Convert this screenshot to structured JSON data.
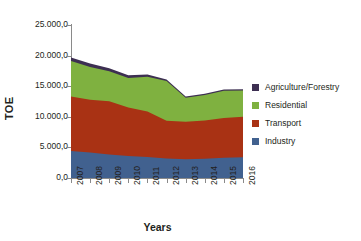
{
  "chart_data": {
    "type": "area",
    "stacked": true,
    "title": "",
    "xlabel": "Years",
    "ylabel": "TOE",
    "categories": [
      "2007",
      "2008",
      "2009",
      "2010",
      "2011",
      "2012",
      "2013",
      "2014",
      "2015",
      "2016"
    ],
    "ylim": [
      0,
      25000
    ],
    "ytick_values": [
      0,
      5000,
      10000,
      15000,
      20000,
      25000
    ],
    "ytick_labels": [
      "0,0",
      "5.000,0",
      "10.000,0",
      "15.000,0",
      "20.000,0",
      "25.000,0"
    ],
    "grid": false,
    "legend_position": "right",
    "series": [
      {
        "name": "Industry",
        "color": "#41618f",
        "values": [
          4400,
          4150,
          3850,
          3600,
          3450,
          3200,
          3050,
          3150,
          3300,
          3400
        ]
      },
      {
        "name": "Transport",
        "color": "#a93214",
        "values": [
          8900,
          8650,
          8700,
          7900,
          7400,
          6150,
          6150,
          6250,
          6500,
          6600
        ]
      },
      {
        "name": "Residential",
        "color": "#7fb140",
        "values": [
          5800,
          5350,
          4900,
          4850,
          5700,
          6500,
          3900,
          4150,
          4450,
          4300
        ]
      },
      {
        "name": "Agriculture/Forestry",
        "color": "#3d2f52",
        "values": [
          600,
          550,
          500,
          450,
          350,
          250,
          200,
          200,
          200,
          200
        ]
      }
    ],
    "cumulative": {
      "industry": [
        4400,
        4150,
        3850,
        3600,
        3450,
        3200,
        3050,
        3150,
        3300,
        3400
      ],
      "transport_top": [
        13300,
        12800,
        12550,
        11500,
        10850,
        9350,
        9200,
        9400,
        9800,
        10000
      ],
      "residential_top": [
        19100,
        18150,
        17450,
        16350,
        16550,
        15850,
        13100,
        13550,
        14250,
        14300
      ],
      "agriculture_top": [
        19700,
        18700,
        17950,
        16800,
        16900,
        16100,
        13300,
        13750,
        14450,
        14500
      ]
    }
  },
  "legend": {
    "items": [
      {
        "label": "Agriculture/Forestry",
        "color": "#3d2f52"
      },
      {
        "label": "Residential",
        "color": "#7fb140"
      },
      {
        "label": "Transport",
        "color": "#a93214"
      },
      {
        "label": "Industry",
        "color": "#41618f"
      }
    ]
  },
  "axes": {
    "y_title": "TOE",
    "x_title": "Years"
  }
}
